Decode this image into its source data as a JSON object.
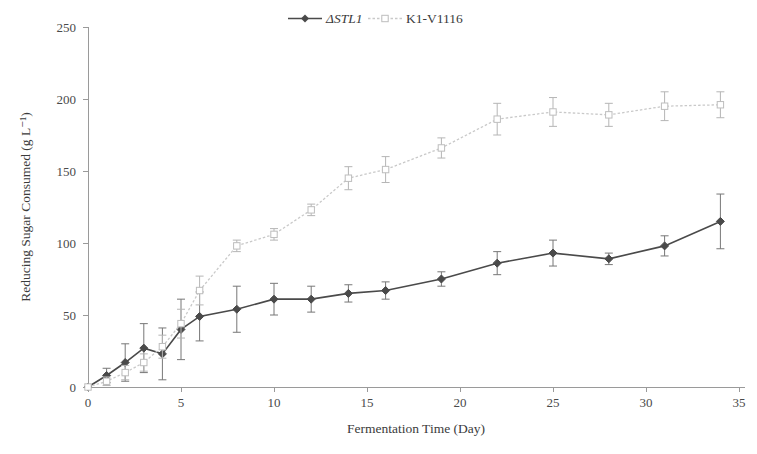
{
  "chart_data": {
    "type": "line",
    "title": "",
    "xlabel": "Fermentation Time (Day)",
    "ylabel": "Reducing Sugar Consumed (g L⁻¹)",
    "xlim": [
      0,
      35
    ],
    "ylim": [
      0,
      250
    ],
    "xticks": [
      0,
      5,
      10,
      15,
      20,
      25,
      30,
      35
    ],
    "yticks": [
      0,
      50,
      100,
      150,
      200,
      250
    ],
    "grid": false,
    "legend_position": "top-center",
    "error_bars": "standard deviation",
    "series": [
      {
        "name": "ΔSTL1",
        "italic": true,
        "color": "#4a4a4a",
        "line_style": "solid",
        "marker": "filled-diamond",
        "x": [
          0,
          1,
          2,
          3,
          4,
          5,
          6,
          8,
          10,
          12,
          14,
          16,
          19,
          22,
          25,
          28,
          31,
          34
        ],
        "y": [
          0,
          8,
          17,
          27,
          23,
          40,
          49,
          54,
          61,
          61,
          65,
          67,
          75,
          86,
          93,
          89,
          98,
          115
        ],
        "yerr": [
          0,
          5,
          13,
          17,
          18,
          21,
          17,
          16,
          11,
          9,
          6,
          6,
          5,
          8,
          9,
          4,
          7,
          19
        ]
      },
      {
        "name": "K1-V1116",
        "italic": false,
        "color": "#c9c9c9",
        "line_style": "dotted",
        "marker": "open-square",
        "x": [
          0,
          1,
          2,
          3,
          4,
          5,
          6,
          8,
          10,
          12,
          14,
          16,
          19,
          22,
          25,
          28,
          31,
          34
        ],
        "y": [
          0,
          4,
          10,
          17,
          28,
          44,
          67,
          98,
          106,
          123,
          145,
          151,
          166,
          186,
          191,
          189,
          195,
          196
        ],
        "yerr": [
          0,
          3,
          5,
          6,
          8,
          10,
          10,
          4,
          4,
          4,
          8,
          9,
          7,
          11,
          10,
          8,
          10,
          9
        ]
      }
    ]
  },
  "legend": {
    "items": [
      {
        "label": "ΔSTL1"
      },
      {
        "label": "K1-V1116"
      }
    ]
  },
  "axes": {
    "y_title": "Reducing Sugar Consumed (g L⁻¹)",
    "x_title": "Fermentation Time (Day)",
    "y_tick_labels": [
      "250",
      "200",
      "150",
      "100",
      "50",
      "0"
    ],
    "x_tick_labels": [
      "0",
      "5",
      "10",
      "15",
      "20",
      "25",
      "30",
      "35"
    ]
  }
}
